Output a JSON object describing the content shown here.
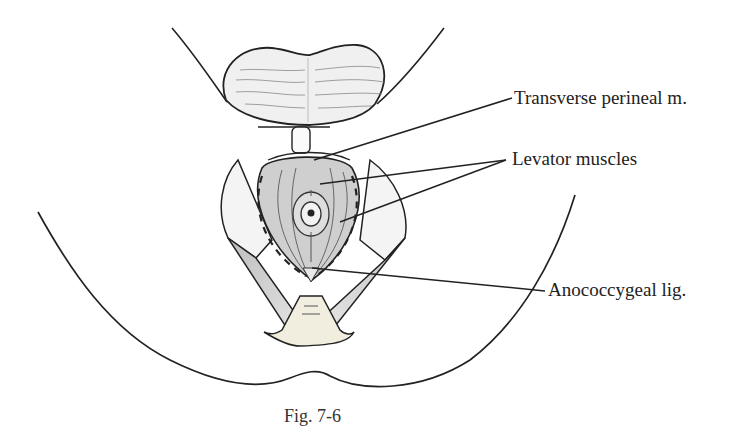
{
  "figure": {
    "caption": "Fig. 7-6",
    "labels": {
      "transverse": "Transverse perineal m.",
      "levator": "Levator muscles",
      "anococcygeal": "Anococcygeal lig."
    },
    "colors": {
      "ink": "#222222",
      "muscle_fill": "#cfcfcf",
      "muscle_dark": "#a9a9a9",
      "background": "#ffffff"
    }
  }
}
